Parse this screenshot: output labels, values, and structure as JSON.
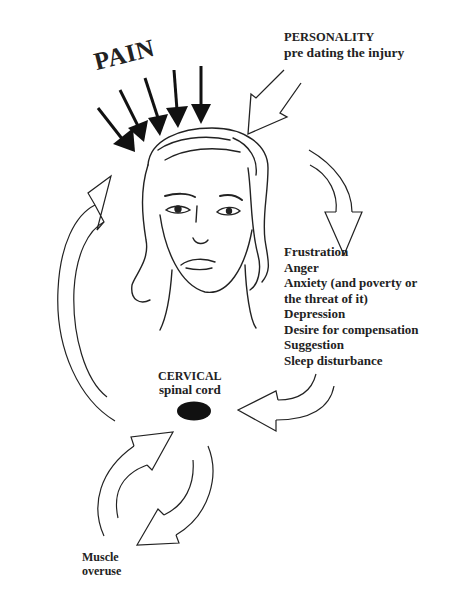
{
  "diagram": {
    "pain_label": "PAIN",
    "personality": {
      "title": "PERSONALITY",
      "subtitle": "pre dating the injury"
    },
    "factors": [
      "Frustration",
      "Anger",
      "Anxiety (and poverty or",
      "the threat of it)",
      "Depression",
      "Desire for compensation",
      "Suggestion",
      "Sleep disturbance"
    ],
    "cervical": {
      "title": "CERVICAL",
      "subtitle": "spinal cord"
    },
    "muscle": {
      "line1": "Muscle",
      "line2": "overuse"
    },
    "colors": {
      "ink": "#111111",
      "background": "#ffffff"
    }
  }
}
